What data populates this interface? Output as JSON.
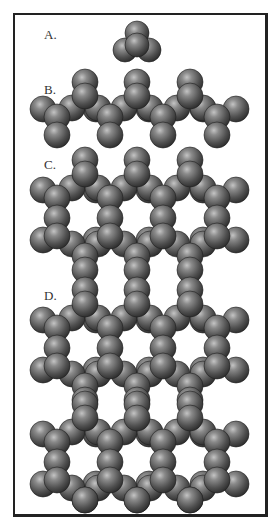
{
  "figure": {
    "panels": [
      {
        "id": "A",
        "label": "A.",
        "label_pos": [
          44,
          27
        ],
        "description": "single atom cluster (tetrahedral)"
      },
      {
        "id": "B",
        "label": "B.",
        "label_pos": [
          44,
          82
        ],
        "description": "zigzag chain"
      },
      {
        "id": "C",
        "label": "C.",
        "label_pos": [
          44,
          157
        ],
        "description": "fused hexagonal ring layer"
      },
      {
        "id": "D",
        "label": "D.",
        "label_pos": [
          44,
          288
        ],
        "description": "two stacked fused hexagonal ring layers"
      }
    ],
    "sphere": {
      "radius": 13,
      "fill_light": "#9a9a9a",
      "fill_mid": "#5c5c5c",
      "fill_dark": "#2a2a2a",
      "edge": "#1e1e1e"
    },
    "frame": {
      "border_color": "#222222",
      "background": "#ffffff"
    }
  }
}
